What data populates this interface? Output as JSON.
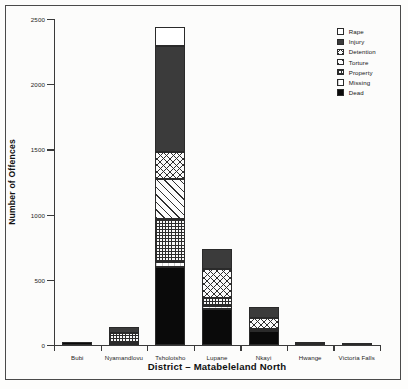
{
  "chart_data": {
    "type": "bar",
    "subtype": "stacked-bar",
    "title": "",
    "xlabel": "District – Matabeleland North",
    "ylabel": "Number of Offences",
    "ylim": [
      0,
      2500
    ],
    "yticks": [
      0,
      500,
      1000,
      1500,
      2000,
      2500
    ],
    "ytick_labels": [
      "0",
      "500",
      "1000",
      "1500",
      "2000",
      "2500"
    ],
    "grid": false,
    "legend_position": "top-right",
    "categories": [
      "Bubi",
      "Nyamandlovu",
      "Tsholotsho",
      "Lupane",
      "Nkayi",
      "Hwange",
      "Victoria Falls"
    ],
    "series": [
      {
        "name": "Dead",
        "pattern": "solid-black",
        "values": [
          20,
          15,
          600,
          280,
          110,
          5,
          3
        ]
      },
      {
        "name": "Missing",
        "pattern": "light-dashed",
        "values": [
          0,
          0,
          40,
          20,
          15,
          0,
          0
        ]
      },
      {
        "name": "Property",
        "pattern": "grid",
        "values": [
          0,
          80,
          330,
          60,
          0,
          8,
          0
        ]
      },
      {
        "name": "Torture",
        "pattern": "diagonal",
        "values": [
          0,
          0,
          300,
          0,
          0,
          0,
          0
        ]
      },
      {
        "name": "Detention",
        "pattern": "crosshatch",
        "values": [
          0,
          0,
          210,
          220,
          85,
          0,
          0
        ]
      },
      {
        "name": "Injury",
        "pattern": "solid-dark",
        "values": [
          0,
          45,
          810,
          160,
          85,
          0,
          0
        ]
      },
      {
        "name": "Rape",
        "pattern": "white",
        "values": [
          0,
          0,
          150,
          0,
          0,
          0,
          0
        ]
      }
    ],
    "totals": [
      20,
      140,
      2440,
      740,
      295,
      13,
      3
    ],
    "legend": [
      {
        "label": "Rape",
        "pattern": "white"
      },
      {
        "label": "Injury",
        "pattern": "solid-dark"
      },
      {
        "label": "Detention",
        "pattern": "crosshatch"
      },
      {
        "label": "Torture",
        "pattern": "diagonal"
      },
      {
        "label": "Property",
        "pattern": "grid"
      },
      {
        "label": "Missing",
        "pattern": "light-dashed"
      },
      {
        "label": "Dead",
        "pattern": "solid-black"
      }
    ],
    "colors": {
      "axis": "#3a3a3a",
      "solid_black": "#0a0a0a",
      "solid_dark": "#3b3b3b",
      "outline": "#2a2a2a",
      "page": "#fdfdfc"
    }
  }
}
